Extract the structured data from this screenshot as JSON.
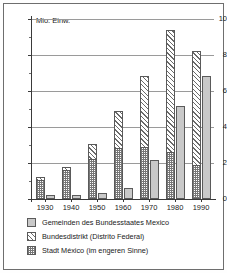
{
  "chart_data": {
    "type": "bar",
    "title": "",
    "subtitle": "",
    "xlabel": "",
    "ylabel": "Mio. Einw.",
    "ylim": [
      0,
      10
    ],
    "yticks": [
      0,
      2,
      4,
      6,
      8,
      10
    ],
    "ytick_labels": [
      "0",
      "2",
      "4",
      "6",
      "8",
      "10"
    ],
    "yminor_ticks": [
      1,
      3,
      5,
      7,
      9
    ],
    "grid": "horizontal",
    "legend_position": "below",
    "grouping": "grouped-with-stacked-base",
    "categories": [
      "1930",
      "1940",
      "1950",
      "1960",
      "1970",
      "1980",
      "1990"
    ],
    "series": [
      {
        "name": "Gemeinden des Bundesstaates Mexico",
        "pattern": "solid-grey",
        "values": [
          0.22,
          0.25,
          0.35,
          0.6,
          2.15,
          5.15,
          6.85
        ]
      },
      {
        "name": "Bundesdistrikt (Distrito Federal)",
        "pattern": "diagonal-hatch",
        "values": [
          1.25,
          1.8,
          3.05,
          4.9,
          6.85,
          9.4,
          8.2
        ]
      },
      {
        "name": "Stadt México (im engeren Sinne)",
        "pattern": "checker",
        "values": [
          1.05,
          1.6,
          2.25,
          2.85,
          2.9,
          2.6,
          1.9
        ]
      }
    ]
  },
  "axis": {
    "y_title": "Mio. Einw."
  },
  "legend": {
    "items": [
      {
        "label": "Gemeinden des Bundesstaates Mexico",
        "swatch": "solid-grey-swatch"
      },
      {
        "label": "Bundesdistrikt (Distrito Federal)",
        "swatch": "hatch-swatch"
      },
      {
        "label": "Stadt México (im engeren Sinne)",
        "swatch": "checker-swatch"
      }
    ]
  },
  "colors": {
    "solid": "#c9c9c9",
    "hatch_line": "#6a6a6a",
    "checker": "#777777",
    "axis": "#3a3a3a",
    "grid": "#9a9a9a",
    "frame": "#6e6e6e",
    "background": "#ffffff"
  }
}
